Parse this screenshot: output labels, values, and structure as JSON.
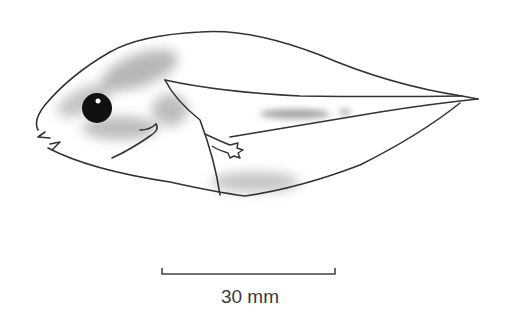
{
  "figure": {
    "scale_bar": {
      "label": "30 mm",
      "length_mm": 30
    },
    "colors": {
      "line": "#333333",
      "shade": "#8a8a8a",
      "eye": "#111111",
      "background": "#ffffff"
    }
  }
}
